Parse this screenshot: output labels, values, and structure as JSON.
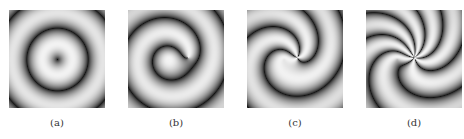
{
  "figure": {
    "panels": [
      {
        "id": "a",
        "caption": "(a)",
        "pattern": "concentric-rings",
        "description": "Concentric circular fringes centered in panel",
        "center": [
          0.5,
          0.5
        ],
        "ring_period": 0.32,
        "singularity_strength": 0
      },
      {
        "id": "b",
        "caption": "(b)",
        "pattern": "rings-with-singularity",
        "description": "Circular fringes with a point singularity right of center; fringes bulge to the left",
        "center": [
          0.42,
          0.5
        ],
        "singularity": [
          0.62,
          0.48
        ],
        "ring_period": 0.32,
        "singularity_strength": 1
      },
      {
        "id": "c",
        "caption": "(c)",
        "pattern": "rings-with-singularity",
        "description": "Stronger singularity; fringes fan out from the point into the right half",
        "center": [
          0.38,
          0.5
        ],
        "singularity": [
          0.52,
          0.48
        ],
        "ring_period": 0.32,
        "singularity_strength": 3
      },
      {
        "id": "d",
        "caption": "(d)",
        "pattern": "rings-with-singularity",
        "description": "Strongest singularity; many radial fringes emanating from the point",
        "center": [
          0.32,
          0.5
        ],
        "singularity": [
          0.5,
          0.48
        ],
        "ring_period": 0.32,
        "singularity_strength": 7
      }
    ],
    "colors": {
      "fringe_dark": "#111111",
      "fringe_light": "#f4f4f4",
      "background": "#ffffff",
      "caption_text": "#333333"
    }
  }
}
